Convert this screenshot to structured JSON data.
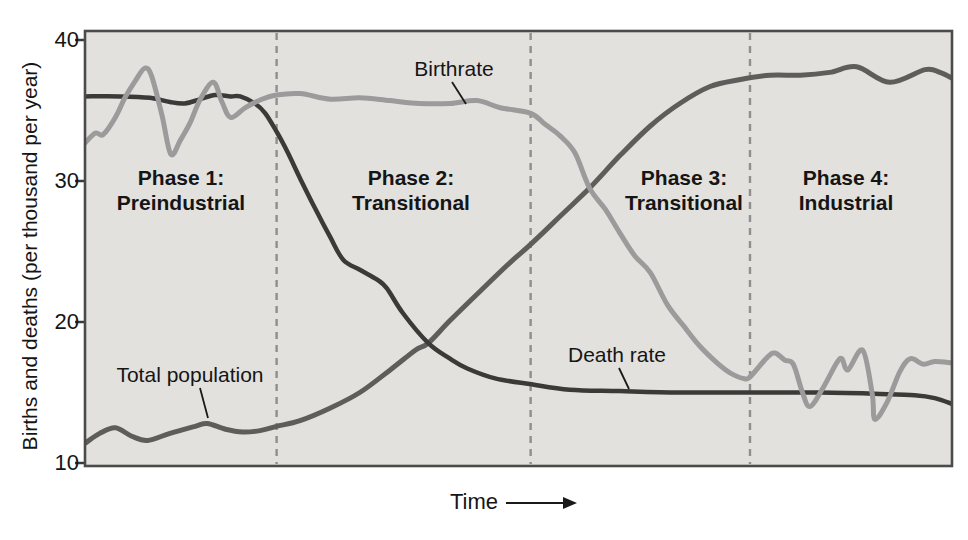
{
  "figure": {
    "y_axis_title": "Births and deaths (per thousand per year)",
    "x_axis_label": "Time",
    "y_ticks": [
      "40",
      "30",
      "20",
      "10"
    ],
    "phase_labels": [
      {
        "line1": "Phase 1:",
        "line2": "Preindustrial"
      },
      {
        "line1": "Phase 2:",
        "line2": "Transitional"
      },
      {
        "line1": "Phase 3:",
        "line2": "Transitional"
      },
      {
        "line1": "Phase 4:",
        "line2": "Industrial"
      }
    ],
    "curve_labels": {
      "birthrate": "Birthrate",
      "death_rate": "Death rate",
      "population": "Total population"
    }
  },
  "chart_data": {
    "type": "line",
    "title": "",
    "xlabel": "Time",
    "ylabel": "Births and deaths (per thousand per year)",
    "x_range": [
      0,
      100
    ],
    "ylim": [
      10,
      40
    ],
    "y_tick_values": [
      40,
      30,
      20,
      10
    ],
    "grid": false,
    "legend_position": "inline-annotations",
    "phases": [
      {
        "label": "Phase 1: Preindustrial",
        "x_start": 0,
        "x_end": 22.1,
        "label_center_px": 181
      },
      {
        "label": "Phase 2: Transitional",
        "x_start": 22.1,
        "x_end": 51.4,
        "label_center_px": 411
      },
      {
        "label": "Phase 3: Transitional",
        "x_start": 51.4,
        "x_end": 76.7,
        "label_center_px": 684
      },
      {
        "label": "Phase 4: Industrial",
        "x_start": 76.7,
        "x_end": 100,
        "label_center_px": 846
      }
    ],
    "phase_divider_x": [
      22.1,
      51.4,
      76.7
    ],
    "series": [
      {
        "id": "total-population",
        "name": "Total population",
        "color": "#5d5d5b",
        "stroke_width": 5,
        "points": [
          [
            0,
            11.4
          ],
          [
            1.7,
            12.1
          ],
          [
            3.5,
            12.5
          ],
          [
            5.4,
            11.9
          ],
          [
            7.2,
            11.6
          ],
          [
            9.8,
            12.1
          ],
          [
            12.7,
            12.6
          ],
          [
            14.1,
            12.8
          ],
          [
            16.2,
            12.4
          ],
          [
            18.2,
            12.2
          ],
          [
            20.2,
            12.3
          ],
          [
            22.1,
            12.6
          ],
          [
            24.8,
            13.0
          ],
          [
            28.3,
            13.9
          ],
          [
            31.7,
            15.0
          ],
          [
            35.2,
            16.6
          ],
          [
            38.1,
            18.0
          ],
          [
            39.6,
            18.5
          ],
          [
            42.1,
            20.1
          ],
          [
            45.6,
            22.2
          ],
          [
            49,
            24.2
          ],
          [
            51.4,
            25.5
          ],
          [
            54.8,
            27.5
          ],
          [
            58.2,
            29.5
          ],
          [
            61.7,
            31.8
          ],
          [
            65.2,
            33.9
          ],
          [
            68.6,
            35.5
          ],
          [
            72.1,
            36.7
          ],
          [
            75.6,
            37.2
          ],
          [
            79,
            37.5
          ],
          [
            82.5,
            37.5
          ],
          [
            85.9,
            37.7
          ],
          [
            89,
            38.1
          ],
          [
            92.8,
            37.0
          ],
          [
            96.9,
            37.9
          ],
          [
            98.6,
            37.7
          ],
          [
            100,
            37.3
          ]
        ]
      },
      {
        "id": "death-rate",
        "name": "Death rate",
        "color": "#3a3a38",
        "stroke_width": 4.5,
        "points": [
          [
            0,
            36.0
          ],
          [
            4,
            36.0
          ],
          [
            7.5,
            35.9
          ],
          [
            9.8,
            35.6
          ],
          [
            11.5,
            35.5
          ],
          [
            13.3,
            35.8
          ],
          [
            15,
            36.1
          ],
          [
            16.8,
            36.0
          ],
          [
            17.9,
            36.0
          ],
          [
            19.6,
            35.5
          ],
          [
            20.8,
            34.8
          ],
          [
            22.1,
            33.5
          ],
          [
            23.4,
            32.0
          ],
          [
            24.8,
            30.2
          ],
          [
            26.5,
            28.1
          ],
          [
            28.3,
            26.0
          ],
          [
            29.8,
            24.4
          ],
          [
            31.7,
            23.7
          ],
          [
            33.7,
            23.0
          ],
          [
            34.8,
            22.4
          ],
          [
            36.7,
            20.6
          ],
          [
            39.6,
            18.5
          ],
          [
            42.1,
            17.4
          ],
          [
            44.1,
            16.7
          ],
          [
            47.3,
            16.0
          ],
          [
            51.3,
            15.6
          ],
          [
            55.9,
            15.2
          ],
          [
            61.7,
            15.1
          ],
          [
            68.6,
            15.0
          ],
          [
            76.7,
            15.0
          ],
          [
            84.8,
            15.0
          ],
          [
            91.7,
            14.9
          ],
          [
            95.7,
            14.8
          ],
          [
            98,
            14.6
          ],
          [
            100,
            14.2
          ]
        ]
      },
      {
        "id": "birthrate",
        "name": "Birthrate",
        "color": "#9b9b9b",
        "stroke_width": 5,
        "points": [
          [
            0,
            32.7
          ],
          [
            1.2,
            33.4
          ],
          [
            2.1,
            33.3
          ],
          [
            3.5,
            34.5
          ],
          [
            4.6,
            35.9
          ],
          [
            5.8,
            37.1
          ],
          [
            6.9,
            38.0
          ],
          [
            7.7,
            37.4
          ],
          [
            8.9,
            34.6
          ],
          [
            9.9,
            31.9
          ],
          [
            11,
            32.9
          ],
          [
            12.1,
            34.1
          ],
          [
            13.3,
            35.8
          ],
          [
            14.8,
            37.0
          ],
          [
            15.8,
            35.6
          ],
          [
            16.8,
            34.5
          ],
          [
            18.5,
            35.2
          ],
          [
            20.4,
            35.8
          ],
          [
            22.1,
            36.1
          ],
          [
            24.8,
            36.2
          ],
          [
            28.3,
            35.8
          ],
          [
            31.7,
            35.9
          ],
          [
            35.2,
            35.7
          ],
          [
            38.6,
            35.5
          ],
          [
            42.1,
            35.5
          ],
          [
            45.2,
            35.7
          ],
          [
            47.9,
            35.2
          ],
          [
            51.4,
            34.8
          ],
          [
            53.1,
            34.0
          ],
          [
            54.8,
            33.2
          ],
          [
            56.5,
            32.0
          ],
          [
            58.2,
            29.5
          ],
          [
            60,
            28.0
          ],
          [
            61.7,
            26.3
          ],
          [
            63.4,
            24.7
          ],
          [
            65.2,
            23.5
          ],
          [
            67.2,
            21.2
          ],
          [
            69.2,
            19.6
          ],
          [
            70.9,
            18.3
          ],
          [
            72.9,
            17.1
          ],
          [
            74.4,
            16.4
          ],
          [
            75.9,
            16.0
          ],
          [
            76.7,
            16.1
          ],
          [
            78.7,
            17.5
          ],
          [
            79.6,
            17.8
          ],
          [
            80.7,
            17.3
          ],
          [
            81.7,
            17.0
          ],
          [
            82.7,
            15.1
          ],
          [
            83.6,
            14.0
          ],
          [
            85.1,
            15.3
          ],
          [
            86.7,
            17.1
          ],
          [
            87.3,
            17.4
          ],
          [
            88,
            16.6
          ],
          [
            89.7,
            18.0
          ],
          [
            90.8,
            14.9
          ],
          [
            91.1,
            13.1
          ],
          [
            92.5,
            14.3
          ],
          [
            94,
            16.5
          ],
          [
            95.2,
            17.4
          ],
          [
            96.7,
            17.0
          ],
          [
            98,
            17.2
          ],
          [
            100,
            17.1
          ]
        ]
      }
    ],
    "annotations": [
      {
        "id": "birthrate-label-pointer",
        "from": [
          452,
          82
        ],
        "to": [
          466,
          104
        ]
      },
      {
        "id": "population-label-pointer",
        "from": [
          200,
          388
        ],
        "to": [
          208,
          418
        ]
      },
      {
        "id": "death-rate-label-pointer",
        "from": [
          619,
          368
        ],
        "to": [
          629,
          389
        ]
      }
    ],
    "time_arrow": {
      "x1": 506,
      "x2": 563,
      "tip_x": 577,
      "y": 503
    },
    "layout": {
      "left": 85,
      "right": 952,
      "top": 31,
      "bottom": 466,
      "y_top": 40,
      "y_bottom": 463,
      "v_min": 10,
      "v_max": 40
    },
    "colors": {
      "plot_bg": "#e3e1de",
      "border": "#4b4b49",
      "divider": "#8f8f8f",
      "tick": "#3a3a38",
      "annotation_line": "#1a1a1a",
      "text": "#151515"
    }
  }
}
